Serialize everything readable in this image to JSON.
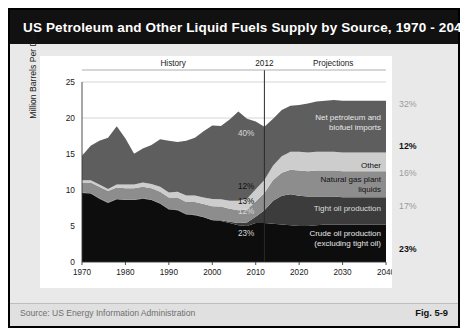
{
  "figure": {
    "title": "US Petroleum and Other Liquid Fuels Supply by Source, 1970 - 2040",
    "source": "Source:  US Energy Information Administration",
    "fig_number": "Fig. 5-9"
  },
  "chart_data": {
    "type": "area",
    "title": "US Petroleum and Other Liquid Fuels Supply by Source, 1970 - 2040",
    "xlabel": "",
    "ylabel": "Million Barrels Per Day",
    "xlim": [
      1970,
      2040
    ],
    "ylim": [
      0,
      25
    ],
    "grid": true,
    "legend_position": "inline-right",
    "yticks": [
      "0",
      "5",
      "10",
      "15",
      "20",
      "25"
    ],
    "xticks": [
      "1970",
      "1980",
      "1990",
      "2000",
      "2010",
      "2020",
      "2030",
      "2040"
    ],
    "annotations": {
      "history": "History",
      "divider_year": "2012",
      "projections": "Projections"
    },
    "interior_labels": [
      {
        "text": "40%",
        "series": "Net petroleum and biofuel imports"
      },
      {
        "text": "12%",
        "series": "Other"
      },
      {
        "text": "13%",
        "series": "Natural gas plant liquids"
      },
      {
        "text": "12%",
        "series": "Tight oil production"
      },
      {
        "text": "23%",
        "series": "Crude oil production (excluding tight oil)"
      }
    ],
    "x": [
      1970,
      1972,
      1974,
      1976,
      1978,
      1980,
      1982,
      1984,
      1986,
      1988,
      1990,
      1992,
      1994,
      1996,
      1998,
      2000,
      2002,
      2004,
      2006,
      2008,
      2010,
      2012,
      2014,
      2016,
      2018,
      2020,
      2022,
      2024,
      2026,
      2028,
      2030,
      2032,
      2034,
      2036,
      2038,
      2040
    ],
    "series": [
      {
        "name": "Crude oil production (excluding tight oil)",
        "end_label": "Crude oil production (excluding tight oil)",
        "end_pct": "23%",
        "color": "#0d0d0d",
        "values": [
          9.6,
          9.5,
          8.8,
          8.2,
          8.7,
          8.6,
          8.6,
          8.8,
          8.6,
          8.1,
          7.3,
          7.2,
          6.6,
          6.5,
          6.2,
          5.8,
          5.7,
          5.4,
          5.1,
          5.0,
          5.4,
          5.4,
          5.3,
          5.2,
          5.1,
          5.0,
          5.0,
          5.1,
          5.2,
          5.2,
          5.2,
          5.2,
          5.2,
          5.2,
          5.2,
          5.2
        ]
      },
      {
        "name": "Tight oil production",
        "end_label": "Tight oil production",
        "end_pct": "17%",
        "color": "#3c3c3c",
        "values": [
          0.05,
          0.05,
          0.05,
          0.05,
          0.05,
          0.05,
          0.05,
          0.05,
          0.05,
          0.05,
          0.05,
          0.05,
          0.05,
          0.05,
          0.05,
          0.05,
          0.1,
          0.2,
          0.3,
          0.5,
          0.9,
          1.8,
          3.2,
          4.0,
          4.3,
          4.2,
          4.1,
          4.0,
          3.9,
          3.9,
          3.8,
          3.8,
          3.8,
          3.8,
          3.8,
          3.8
        ]
      },
      {
        "name": "Natural gas plant liquids",
        "end_label": "Natural gas plant liquids",
        "end_pct": "16%",
        "color": "#8d8d8d",
        "values": [
          1.4,
          1.5,
          1.6,
          1.6,
          1.6,
          1.6,
          1.6,
          1.6,
          1.6,
          1.6,
          1.6,
          1.7,
          1.7,
          1.8,
          1.8,
          1.9,
          1.9,
          1.8,
          1.8,
          1.8,
          2.1,
          2.4,
          2.9,
          3.2,
          3.4,
          3.5,
          3.5,
          3.6,
          3.6,
          3.6,
          3.6,
          3.6,
          3.6,
          3.6,
          3.6,
          3.6
        ]
      },
      {
        "name": "Other",
        "end_label": "Other",
        "end_pct": "12%",
        "color": "#cdcdcd",
        "values": [
          0.3,
          0.3,
          0.3,
          0.3,
          0.4,
          0.5,
          0.5,
          0.6,
          0.6,
          0.7,
          0.7,
          0.8,
          0.9,
          0.9,
          0.9,
          1.0,
          1.0,
          1.1,
          1.3,
          1.5,
          1.7,
          1.8,
          2.0,
          2.3,
          2.5,
          2.6,
          2.6,
          2.6,
          2.6,
          2.6,
          2.6,
          2.6,
          2.6,
          2.6,
          2.6,
          2.6
        ]
      },
      {
        "name": "Net petroleum and biofuel imports",
        "end_label": "Net petroleum and biofuel imports",
        "end_pct": "32%",
        "color": "#5e5e5e",
        "values": [
          3.4,
          4.8,
          6.1,
          7.1,
          8.1,
          6.4,
          4.3,
          4.7,
          5.4,
          6.6,
          7.2,
          6.9,
          7.6,
          8.0,
          9.2,
          10.2,
          10.2,
          11.3,
          12.4,
          11.1,
          9.4,
          7.4,
          6.5,
          6.4,
          6.4,
          6.5,
          6.8,
          7.0,
          7.1,
          7.2,
          7.2,
          7.2,
          7.2,
          7.2,
          7.2,
          7.2
        ]
      }
    ]
  }
}
